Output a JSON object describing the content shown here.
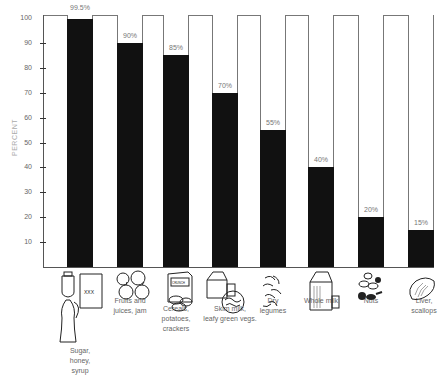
{
  "chart_data": {
    "type": "bar",
    "title": "",
    "xlabel": "",
    "ylabel": "PERCENT",
    "ylim": [
      0,
      100
    ],
    "yticks": [
      10,
      20,
      30,
      40,
      50,
      60,
      70,
      80,
      90,
      100
    ],
    "grid": false,
    "legend": null,
    "categories": [
      "Sugar, honey, syrup",
      "Fruits and juices, jam",
      "Cereals, potatoes, crackers",
      "Skim milk, leafy green vegs.",
      "Dry legumes",
      "Whole milk",
      "Nuts",
      "Liver, scallops"
    ],
    "values": [
      99.5,
      90,
      85,
      70,
      55,
      40,
      20,
      15
    ],
    "value_labels": [
      "99.5%",
      "90%",
      "85%",
      "70%",
      "55%",
      "40%",
      "20%",
      "15%"
    ],
    "bar_color": "#111111",
    "frame_color": "#777777"
  },
  "axis": {
    "ylabel": "PERCENT",
    "ticks": [
      "10",
      "20",
      "30",
      "40",
      "50",
      "60",
      "70",
      "80",
      "90",
      "100"
    ]
  },
  "bars": [
    {
      "label_lines": [
        "Sugar,",
        "honey,",
        "syrup"
      ],
      "value": 99.5,
      "value_label": "99.5%",
      "icon": "sugar-honey-syrup-icon"
    },
    {
      "label_lines": [
        "Fruits and",
        "juices, jam"
      ],
      "value": 90,
      "value_label": "90%",
      "icon": "fruit-icon"
    },
    {
      "label_lines": [
        "Cereals,",
        "potatoes,",
        "crackers"
      ],
      "value": 85,
      "value_label": "85%",
      "icon": "cereal-box-icon"
    },
    {
      "label_lines": [
        "Skim milk,",
        "leafy green vegs."
      ],
      "value": 70,
      "value_label": "70%",
      "icon": "milk-carton-greens-icon"
    },
    {
      "label_lines": [
        "Dry",
        "legumes"
      ],
      "value": 55,
      "value_label": "55%",
      "icon": "legumes-icon"
    },
    {
      "label_lines": [
        "Whole milk"
      ],
      "value": 40,
      "value_label": "40%",
      "icon": "whole-milk-icon"
    },
    {
      "label_lines": [
        "Nuts"
      ],
      "value": 20,
      "value_label": "20%",
      "icon": "nuts-icon"
    },
    {
      "label_lines": [
        "Liver,",
        "scallops"
      ],
      "value": 15,
      "value_label": "15%",
      "icon": "liver-icon"
    }
  ],
  "icon_text": {
    "sugar_bag": "XXX",
    "cereal_box": "CRUNCH PUFFS"
  }
}
